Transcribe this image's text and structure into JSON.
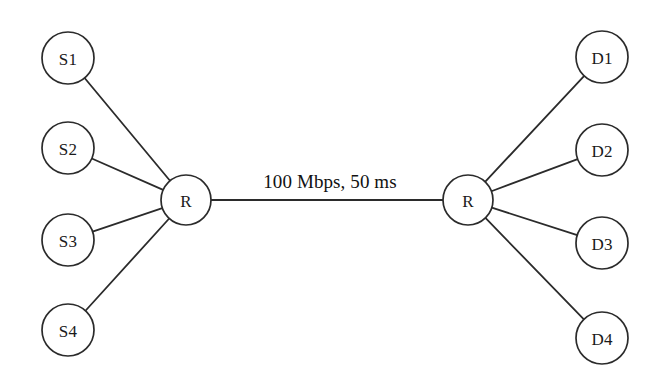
{
  "diagram": {
    "type": "network-topology",
    "shape": "dumbbell",
    "background_color": "#ffffff",
    "stroke_color": "#2b2b2b",
    "text_color": "#1a1a1a",
    "nodes": [
      {
        "id": "S1",
        "label": "S1",
        "role": "source",
        "cx": 68,
        "cy": 58,
        "r": 26
      },
      {
        "id": "S2",
        "label": "S2",
        "role": "source",
        "cx": 68,
        "cy": 148,
        "r": 26
      },
      {
        "id": "S3",
        "label": "S3",
        "role": "source",
        "cx": 68,
        "cy": 240,
        "r": 26
      },
      {
        "id": "S4",
        "label": "S4",
        "role": "source",
        "cx": 68,
        "cy": 330,
        "r": 26
      },
      {
        "id": "RL",
        "label": "R",
        "role": "router",
        "cx": 186,
        "cy": 200,
        "r": 25
      },
      {
        "id": "RR",
        "label": "R",
        "role": "router",
        "cx": 468,
        "cy": 200,
        "r": 25
      },
      {
        "id": "D1",
        "label": "D1",
        "role": "destination",
        "cx": 602,
        "cy": 57,
        "r": 26
      },
      {
        "id": "D2",
        "label": "D2",
        "role": "destination",
        "cx": 602,
        "cy": 150,
        "r": 26
      },
      {
        "id": "D3",
        "label": "D3",
        "role": "destination",
        "cx": 602,
        "cy": 243,
        "r": 26
      },
      {
        "id": "D4",
        "label": "D4",
        "role": "destination",
        "cx": 602,
        "cy": 338,
        "r": 26
      }
    ],
    "edges": [
      {
        "id": "e-s1-rl",
        "from": "S1",
        "to": "RL",
        "label": ""
      },
      {
        "id": "e-s2-rl",
        "from": "S2",
        "to": "RL",
        "label": ""
      },
      {
        "id": "e-s3-rl",
        "from": "S3",
        "to": "RL",
        "label": ""
      },
      {
        "id": "e-s4-rl",
        "from": "S4",
        "to": "RL",
        "label": ""
      },
      {
        "id": "e-rl-rr",
        "from": "RL",
        "to": "RR",
        "label": "100 Mbps, 50 ms"
      },
      {
        "id": "e-rr-d1",
        "from": "RR",
        "to": "D1",
        "label": ""
      },
      {
        "id": "e-rr-d2",
        "from": "RR",
        "to": "D2",
        "label": ""
      },
      {
        "id": "e-rr-d3",
        "from": "RR",
        "to": "D3",
        "label": ""
      },
      {
        "id": "e-rr-d4",
        "from": "RR",
        "to": "D4",
        "label": ""
      }
    ],
    "bottleneck_link": {
      "label": "100 Mbps, 50 ms",
      "bandwidth": "100 Mbps",
      "delay": "50 ms",
      "label_x": 330,
      "label_y": 188
    }
  }
}
